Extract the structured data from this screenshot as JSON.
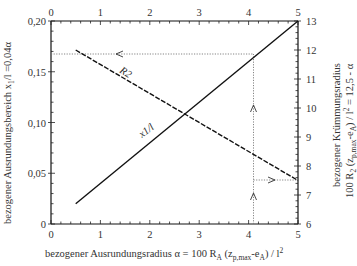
{
  "chart_data": {
    "type": "line",
    "title": "",
    "xlabel": "bezogener Ausrundungsradius  α = 100 R_A (z_p,max-e_A) / l²",
    "xlabel_parts": {
      "prefix": "bezogener Ausrundungsradius  α = 100 R",
      "sub1": "A",
      "mid": " (z",
      "sub2": "p,max",
      "mid2": "-e",
      "sub3": "A",
      "suffix": ") / l",
      "sup": "2"
    },
    "ylabel_left": "bezogener Ausrundungsbereich x1/l =0,04α",
    "ylabel_left_parts": {
      "prefix": "bezogener Ausrundungsbereich x",
      "sub": "1",
      "suffix": "/l =0,04α"
    },
    "ylabel_right_line1": "bezogener Krümmungsradius",
    "ylabel_right_line2": "100 R2 (zp,max-eA) / l² = 12,5 - α",
    "ylabel_right_line2_parts": {
      "prefix": "100 R",
      "sub1": "2",
      "mid": " (z",
      "sub2": "p,max",
      "mid2": "-e",
      "sub3": "A",
      "suffix": ") / l",
      "sup": "2",
      "tail": " = 12,5 - α"
    },
    "x_ticks_bottom": [
      "0",
      "1",
      "2",
      "3",
      "4",
      "5"
    ],
    "x_ticks_top": [
      "0",
      "1",
      "2",
      "3",
      "4",
      "5"
    ],
    "xlim": [
      0,
      5
    ],
    "y_left_ticks": [
      "0",
      "0,05",
      "0,10",
      "0,15",
      "0,20"
    ],
    "y_left_lim": [
      0,
      0.2
    ],
    "y_right_ticks": [
      "6",
      "7",
      "8",
      "9",
      "10",
      "11",
      "12",
      "13"
    ],
    "y_right_lim": [
      6,
      13
    ],
    "grid": false,
    "legend": "none (inline curve labels)",
    "series": [
      {
        "name": "x1/l",
        "label": "x1/l",
        "axis": "left",
        "style": "solid",
        "x": [
          0.5,
          5.0
        ],
        "values": [
          0.02,
          0.2
        ]
      },
      {
        "name": "R2",
        "label": "R2",
        "axis": "right",
        "style": "dashed",
        "x": [
          0.5,
          5.0
        ],
        "values": [
          12.0,
          7.5
        ]
      }
    ],
    "annotations": [
      {
        "type": "reading-guide",
        "style": "dotted",
        "alpha": 4.1,
        "description": "vertical from α=4.1 up to x1/l curve then horizontal left to 0,164 (arrows pointing up and left)"
      },
      {
        "type": "reading-guide",
        "style": "dotted",
        "alpha": 4.1,
        "description": "from α=4.1 on R2 curve horizontal right to 8,4 (arrow pointing right)"
      }
    ],
    "curve_labels": {
      "x1": "x1/l",
      "r2": "R2"
    }
  }
}
